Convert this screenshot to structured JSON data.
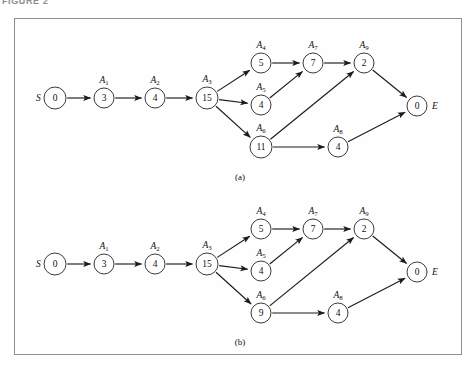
{
  "figure": {
    "caption": "FIGURE 2"
  },
  "panels": [
    {
      "id": "panel-a",
      "label": "(a)",
      "label_x": 240,
      "label_y": 180,
      "nodes": [
        {
          "id": "S",
          "value": "0",
          "activity": "",
          "sub": "",
          "x": 55,
          "y": 98,
          "r": 11,
          "side_label": "S",
          "side": "left"
        },
        {
          "id": "A1",
          "value": "3",
          "activity": "A",
          "sub": "1",
          "x": 104,
          "y": 98,
          "r": 10
        },
        {
          "id": "A2",
          "value": "4",
          "activity": "A",
          "sub": "2",
          "x": 155,
          "y": 98,
          "r": 10
        },
        {
          "id": "A3",
          "value": "15",
          "activity": "A",
          "sub": "3",
          "x": 207,
          "y": 98,
          "r": 11
        },
        {
          "id": "A4",
          "value": "5",
          "activity": "A",
          "sub": "4",
          "x": 261,
          "y": 63,
          "r": 10
        },
        {
          "id": "A5",
          "value": "4",
          "activity": "A",
          "sub": "5",
          "x": 261,
          "y": 105,
          "r": 10
        },
        {
          "id": "A6",
          "value": "11",
          "activity": "A",
          "sub": "6",
          "x": 261,
          "y": 147,
          "r": 11
        },
        {
          "id": "A7",
          "value": "7",
          "activity": "A",
          "sub": "7",
          "x": 313,
          "y": 63,
          "r": 10
        },
        {
          "id": "A8",
          "value": "4",
          "activity": "A",
          "sub": "8",
          "x": 338,
          "y": 147,
          "r": 10
        },
        {
          "id": "A9",
          "value": "2",
          "activity": "A",
          "sub": "9",
          "x": 364,
          "y": 63,
          "r": 10
        },
        {
          "id": "E",
          "value": "0",
          "activity": "",
          "sub": "",
          "x": 417,
          "y": 106,
          "r": 10,
          "side_label": "E",
          "side": "right"
        }
      ],
      "edges": [
        {
          "from": "S",
          "to": "A1"
        },
        {
          "from": "A1",
          "to": "A2"
        },
        {
          "from": "A2",
          "to": "A3"
        },
        {
          "from": "A3",
          "to": "A4"
        },
        {
          "from": "A3",
          "to": "A5"
        },
        {
          "from": "A3",
          "to": "A6"
        },
        {
          "from": "A4",
          "to": "A7"
        },
        {
          "from": "A5",
          "to": "A7"
        },
        {
          "from": "A7",
          "to": "A9"
        },
        {
          "from": "A6",
          "to": "A9"
        },
        {
          "from": "A6",
          "to": "A8"
        },
        {
          "from": "A9",
          "to": "E"
        },
        {
          "from": "A8",
          "to": "E"
        }
      ]
    },
    {
      "id": "panel-b",
      "label": "(b)",
      "label_x": 240,
      "label_y": 345,
      "nodes": [
        {
          "id": "S",
          "value": "0",
          "activity": "",
          "sub": "",
          "x": 55,
          "y": 264,
          "r": 11,
          "side_label": "S",
          "side": "left"
        },
        {
          "id": "A1",
          "value": "3",
          "activity": "A",
          "sub": "1",
          "x": 104,
          "y": 264,
          "r": 10
        },
        {
          "id": "A2",
          "value": "4",
          "activity": "A",
          "sub": "2",
          "x": 155,
          "y": 264,
          "r": 10
        },
        {
          "id": "A3",
          "value": "15",
          "activity": "A",
          "sub": "3",
          "x": 207,
          "y": 264,
          "r": 11
        },
        {
          "id": "A4",
          "value": "5",
          "activity": "A",
          "sub": "4",
          "x": 261,
          "y": 229,
          "r": 10
        },
        {
          "id": "A5",
          "value": "4",
          "activity": "A",
          "sub": "5",
          "x": 261,
          "y": 271,
          "r": 10
        },
        {
          "id": "A6",
          "value": "9",
          "activity": "A",
          "sub": "6",
          "x": 261,
          "y": 313,
          "r": 10
        },
        {
          "id": "A7",
          "value": "7",
          "activity": "A",
          "sub": "7",
          "x": 313,
          "y": 229,
          "r": 10
        },
        {
          "id": "A8",
          "value": "4",
          "activity": "A",
          "sub": "8",
          "x": 338,
          "y": 313,
          "r": 10
        },
        {
          "id": "A9",
          "value": "2",
          "activity": "A",
          "sub": "9",
          "x": 364,
          "y": 229,
          "r": 10
        },
        {
          "id": "E",
          "value": "0",
          "activity": "",
          "sub": "",
          "x": 417,
          "y": 272,
          "r": 10,
          "side_label": "E",
          "side": "right"
        }
      ],
      "edges": [
        {
          "from": "S",
          "to": "A1"
        },
        {
          "from": "A1",
          "to": "A2"
        },
        {
          "from": "A2",
          "to": "A3"
        },
        {
          "from": "A3",
          "to": "A4"
        },
        {
          "from": "A3",
          "to": "A5"
        },
        {
          "from": "A3",
          "to": "A6"
        },
        {
          "from": "A4",
          "to": "A7"
        },
        {
          "from": "A5",
          "to": "A7"
        },
        {
          "from": "A7",
          "to": "A9"
        },
        {
          "from": "A6",
          "to": "A9"
        },
        {
          "from": "A6",
          "to": "A8"
        },
        {
          "from": "A9",
          "to": "E"
        },
        {
          "from": "A8",
          "to": "E"
        }
      ]
    }
  ],
  "colors": {
    "node_stroke": "#262626",
    "edge": "#1b1b1b",
    "panel_border": "#8e8e92",
    "caption": "#8d8d8d",
    "background": "#ffffff"
  }
}
